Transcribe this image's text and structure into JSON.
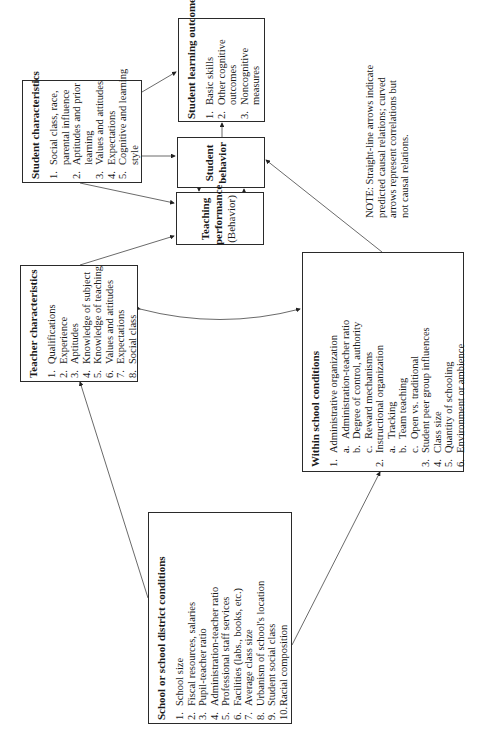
{
  "boxes": {
    "student_characteristics": {
      "title": "Student characteristics",
      "items": [
        {
          "num": "1.",
          "text": "Social class, race,"
        },
        {
          "num": "",
          "text": "parental influence"
        },
        {
          "num": "2.",
          "text": "Aptitudes and prior"
        },
        {
          "num": "",
          "text": "learning"
        },
        {
          "num": "3.",
          "text": "Values and attitudes"
        },
        {
          "num": "4.",
          "text": "Expectations"
        },
        {
          "num": "5.",
          "text": "Cognitive and learning"
        },
        {
          "num": "",
          "text": "style"
        }
      ]
    },
    "student_learning_outcomes": {
      "title": "Student learning outcomes",
      "items": [
        {
          "num": "1.",
          "text": "Basic skills"
        },
        {
          "num": "2.",
          "text": "Other cognitive"
        },
        {
          "num": "",
          "text": "outcomes"
        },
        {
          "num": "3.",
          "text": "Noncognitive"
        },
        {
          "num": "",
          "text": "measures"
        }
      ]
    },
    "student_behavior": {
      "line1": "Student",
      "line2": "behavior"
    },
    "teaching_performance": {
      "line1": "Teaching",
      "line2": "performance",
      "line3": "(Behavior)"
    },
    "teacher_characteristics": {
      "title": "Teacher characteristics",
      "items": [
        {
          "num": "1.",
          "text": "Qualifications"
        },
        {
          "num": "2.",
          "text": "Experience"
        },
        {
          "num": "3.",
          "text": "Aptitudes"
        },
        {
          "num": "4.",
          "text": "Knowledge of subject"
        },
        {
          "num": "5.",
          "text": "Knowledge of teaching"
        },
        {
          "num": "6.",
          "text": "Values and attitudes"
        },
        {
          "num": "7.",
          "text": "Expectations"
        },
        {
          "num": "8.",
          "text": "Social class"
        }
      ]
    },
    "within_school_conditions": {
      "title": "Within school conditions",
      "items": [
        {
          "num": "1.",
          "text": "Administrative organization"
        },
        {
          "num": "a.",
          "text": "Administration-teacher ratio",
          "sub": true
        },
        {
          "num": "b.",
          "text": "Degree of control, authority",
          "sub": true
        },
        {
          "num": "c.",
          "text": "Reward mechanisms",
          "sub": true
        },
        {
          "num": "2.",
          "text": "Instructional organization"
        },
        {
          "num": "a.",
          "text": "Tracking",
          "sub": true
        },
        {
          "num": "b.",
          "text": "Team teaching",
          "sub": true
        },
        {
          "num": "c.",
          "text": "Open vs. traditional",
          "sub": true
        },
        {
          "num": "3.",
          "text": "Student peer group influences"
        },
        {
          "num": "4.",
          "text": "Class size"
        },
        {
          "num": "5.",
          "text": "Quantity of schooling"
        },
        {
          "num": "6.",
          "text": "Environment or ambience"
        }
      ]
    },
    "school_district_conditions": {
      "title": "School or school district conditions",
      "items": [
        {
          "num": "1.",
          "text": "School size"
        },
        {
          "num": "2.",
          "text": "Fiscal resources, salaries"
        },
        {
          "num": "3.",
          "text": "Pupil-teacher ratio"
        },
        {
          "num": "4.",
          "text": "Administration-teacher ratio"
        },
        {
          "num": "5.",
          "text": "Professional staff services"
        },
        {
          "num": "6.",
          "text": "Facilities (labs., books, etc.)"
        },
        {
          "num": "7.",
          "text": "Average class size"
        },
        {
          "num": "8.",
          "text": "Urbanism of school's location"
        },
        {
          "num": "9.",
          "text": "Student social class"
        },
        {
          "num": "10.",
          "text": "Racial composition"
        }
      ]
    }
  },
  "note": {
    "lines": [
      "NOTE: Straight-line arrows indicate",
      "predicted causal relations; curved",
      "arrows represent correlations but",
      "not causal relations."
    ]
  }
}
